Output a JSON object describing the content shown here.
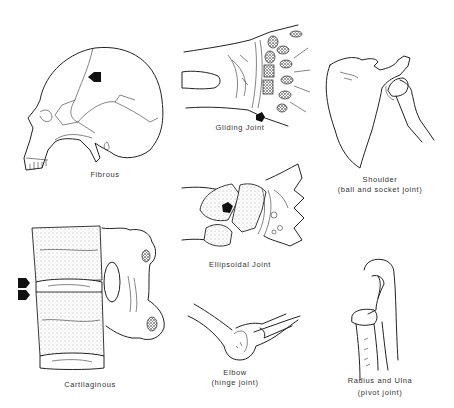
{
  "figure": {
    "panels": [
      {
        "id": "fibrous",
        "label": "Fibrous",
        "subject": "skull (suture)",
        "arrows": 1
      },
      {
        "id": "gliding",
        "label": "Gliding Joint",
        "subject": "wrist carpals",
        "arrows": 1
      },
      {
        "id": "shoulder",
        "label": "Shoulder",
        "sublabel": "(ball and socket joint)",
        "subject": "scapula and humerus",
        "arrows": 0
      },
      {
        "id": "ellipsoidal",
        "label": "Ellipsoidal Joint",
        "subject": "wrist (radiocarpal)",
        "arrows": 1
      },
      {
        "id": "cartilaginous",
        "label": "Cartilaginous",
        "subject": "vertebrae with intervertebral disc",
        "arrows": 2
      },
      {
        "id": "elbow",
        "label": "Elbow",
        "sublabel": "(hinge joint)",
        "subject": "humerus and ulna",
        "arrows": 0
      },
      {
        "id": "radius-ulna",
        "label": "Radius and Ulna",
        "sublabel": "(pivot joint)",
        "subject": "proximal radioulnar joint",
        "arrows": 0
      }
    ]
  },
  "colors": {
    "background": "#ffffff",
    "line": "#222222",
    "arrow": "#111111",
    "text": "#333333"
  }
}
